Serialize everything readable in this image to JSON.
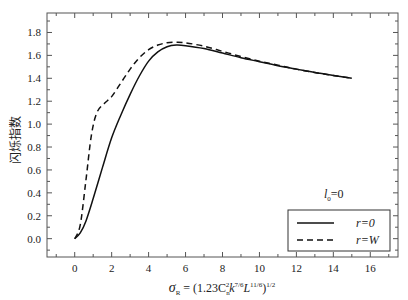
{
  "chart_data": {
    "type": "line",
    "title": "",
    "xlabel": "σ_R = (1.23C_n^2 k^{7/6} L^{11/6})^{1/2}",
    "ylabel": "闪烁指数",
    "xlim": [
      -1.5,
      17.5
    ],
    "ylim": [
      -0.16,
      1.97
    ],
    "xticks": [
      0,
      2,
      4,
      6,
      8,
      10,
      12,
      14,
      16
    ],
    "yticks": [
      0.0,
      0.2,
      0.4,
      0.6,
      0.8,
      1.0,
      1.2,
      1.4,
      1.6,
      1.8
    ],
    "grid": false,
    "legend_position": "lower right",
    "annotations": [
      "l_0=0"
    ],
    "series": [
      {
        "name": "r=0",
        "style": "solid",
        "x": [
          0,
          0.3,
          0.6,
          1.0,
          1.5,
          2.0,
          2.5,
          3.0,
          3.5,
          4.0,
          4.5,
          5.0,
          5.5,
          6.0,
          7.0,
          8.0,
          9.0,
          10.0,
          11.0,
          12.0,
          13.0,
          14.0,
          15.0
        ],
        "y": [
          0.0,
          0.05,
          0.15,
          0.35,
          0.62,
          0.88,
          1.08,
          1.26,
          1.42,
          1.55,
          1.63,
          1.675,
          1.69,
          1.685,
          1.66,
          1.62,
          1.58,
          1.545,
          1.51,
          1.48,
          1.45,
          1.425,
          1.4
        ]
      },
      {
        "name": "r=W",
        "style": "dashed",
        "x": [
          0,
          0.3,
          0.6,
          0.9,
          1.2,
          1.6,
          2.0,
          2.5,
          3.0,
          3.5,
          4.0,
          4.5,
          5.0,
          5.5,
          6.0,
          7.0,
          8.0,
          9.0,
          10.0,
          11.0,
          12.0,
          13.0,
          14.0,
          15.0
        ],
        "y": [
          0.0,
          0.12,
          0.5,
          0.9,
          1.1,
          1.18,
          1.24,
          1.36,
          1.48,
          1.58,
          1.65,
          1.69,
          1.71,
          1.715,
          1.71,
          1.68,
          1.635,
          1.59,
          1.55,
          1.515,
          1.48,
          1.45,
          1.425,
          1.4
        ]
      }
    ]
  },
  "labels": {
    "ylabel": "闪烁指数",
    "xlabel_sigma": "σ",
    "xlabel_sub": "R",
    "xlabel_eq": " = (1.23C",
    "xlabel_n": "n",
    "xlabel_2": "2",
    "xlabel_k": "k",
    "xlabel_k_exp": "7/6",
    "xlabel_L": "L",
    "xlabel_L_exp": "11/6",
    "xlabel_close": ")",
    "xlabel_half": "1/2",
    "annot_l": "l",
    "annot_sub": "0",
    "annot_eq": "=0",
    "legend_solid": "r=0",
    "legend_dashed": "r=W"
  }
}
